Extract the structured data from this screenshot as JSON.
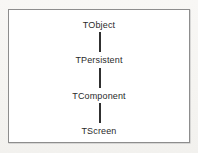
{
  "diagram": {
    "kind": "class-inheritance-chain",
    "frame": {
      "border_color": "#8d8d8d",
      "fill_color": "#ffffff"
    },
    "page_background": "#f7f6f3",
    "text_color": "#2a2a2a",
    "connector_color": "#303030",
    "nodes": [
      {
        "id": "tobject",
        "label": "TObject"
      },
      {
        "id": "tpersistent",
        "label": "TPersistent"
      },
      {
        "id": "tcomponent",
        "label": "TComponent"
      },
      {
        "id": "tscreen",
        "label": "TScreen"
      }
    ],
    "connectors": [
      {
        "id": "tobject-to-tpersistent",
        "from": "TObject",
        "to": "TPersistent",
        "style": "vertical-line"
      },
      {
        "id": "tpersistent-to-tcomponent",
        "from": "TPersistent",
        "to": "TComponent",
        "style": "vertical-line"
      },
      {
        "id": "tcomponent-to-tscreen",
        "from": "TComponent",
        "to": "TScreen",
        "style": "vertical-line"
      }
    ]
  }
}
